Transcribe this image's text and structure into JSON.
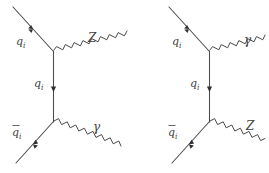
{
  "figure": {
    "kind": "feynman-diagram-pair",
    "background_color": "#ffffff",
    "line_color": "#4a4a4a",
    "label_color": "#3d3d3d",
    "width": 269,
    "height": 173
  },
  "diagrams": [
    {
      "id": "left",
      "name": "qqbar-to-Z-gamma-diagram",
      "incoming_fermion": {
        "label": "q",
        "subscript": "i",
        "overbar": false
      },
      "propagator": {
        "label": "q",
        "subscript": "i",
        "overbar": false
      },
      "incoming_antifermion": {
        "label": "q",
        "subscript": "i",
        "overbar": true
      },
      "top_boson": {
        "label": "Z",
        "type": "wavy"
      },
      "bottom_boson": {
        "label": "γ",
        "type": "wavy"
      }
    },
    {
      "id": "right",
      "name": "qqbar-to-gamma-Z-diagram",
      "incoming_fermion": {
        "label": "q",
        "subscript": "i",
        "overbar": false
      },
      "propagator": {
        "label": "q",
        "subscript": "i",
        "overbar": false
      },
      "incoming_antifermion": {
        "label": "q",
        "subscript": "i",
        "overbar": true
      },
      "top_boson": {
        "label": "γ",
        "type": "wavy"
      },
      "bottom_boson": {
        "label": "Z",
        "type": "wavy"
      }
    }
  ],
  "labels": {
    "left_top_fermion": "q",
    "left_top_fermion_sub": "i",
    "left_propagator": "q",
    "left_propagator_sub": "i",
    "left_bottom_fermion": "q",
    "left_bottom_fermion_sub": "i",
    "left_top_boson": "Z",
    "left_bottom_boson": "γ",
    "right_top_fermion": "q",
    "right_top_fermion_sub": "i",
    "right_propagator": "q",
    "right_propagator_sub": "i",
    "right_bottom_fermion": "q",
    "right_bottom_fermion_sub": "i",
    "right_top_boson": "γ",
    "right_bottom_boson": "Z"
  }
}
